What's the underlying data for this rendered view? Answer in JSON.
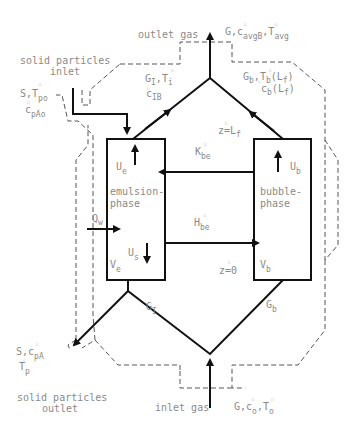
{
  "diagram": {
    "type": "fluidized-bed two-phase reactor model",
    "phases": {
      "emulsion": {
        "label": "emulsion-phase",
        "velocity": "U",
        "velocity_sub": "e",
        "solids_velocity": "U",
        "solids_velocity_sub": "s",
        "volume": "V",
        "volume_sub": "e"
      },
      "bubble": {
        "label": "bubble-phase",
        "velocity": "U",
        "velocity_sub": "b",
        "volume": "V",
        "volume_sub": "b"
      }
    },
    "exchange": {
      "mass": {
        "symbol": "K",
        "sub": "be",
        "star": "☆"
      },
      "heat": {
        "symbol": "H",
        "sub": "be",
        "star": "☆"
      }
    },
    "heat_wall": {
      "symbol": "Q",
      "sub": "w"
    },
    "z_top": {
      "text": "z=L",
      "sub": "f",
      "star": "☆"
    },
    "z_bottom": {
      "text": "z=0",
      "star": "☆"
    },
    "flows": {
      "G_I_bottom": {
        "symbol": "G",
        "sub": "I"
      },
      "G_b_bottom": {
        "symbol": "G",
        "sub": "b"
      },
      "G_I_top": {
        "line1": "G",
        "line1_sub": "I",
        "line1b": ",T",
        "line1b_sub": "i",
        "line2": "c",
        "line2_sub": "IB"
      },
      "G_b_top": {
        "line1": "G",
        "line1_sub": "b",
        "line1b": ",T",
        "line1b_sub": "b",
        "line1c": "(L",
        "line1c_sub": "f",
        "line2": "c",
        "line2_sub": "b",
        "line2b": "(L",
        "line2b_sub": "f"
      }
    },
    "outlet_gas": {
      "label": "outlet gas",
      "vars": "G,c",
      "vars_sub": "avgB",
      "vars2": ",T",
      "vars2_sub": "avg"
    },
    "inlet_gas": {
      "label": "inlet gas",
      "vars": "G,c",
      "vars_sub": "o",
      "vars2": ",T",
      "vars2_sub": "o"
    },
    "solids_inlet": {
      "label_line1": "solid particles",
      "label_line2": "inlet",
      "vars1": "S,T",
      "vars1_sub": "po",
      "vars2": "c",
      "vars2_sub": "pAo"
    },
    "solids_outlet": {
      "label_line1": "solid particles",
      "label_line2": "outlet",
      "vars1": "S,c",
      "vars1_sub": "pA",
      "vars2": "T",
      "vars2_sub": "p"
    },
    "star": "☆"
  }
}
